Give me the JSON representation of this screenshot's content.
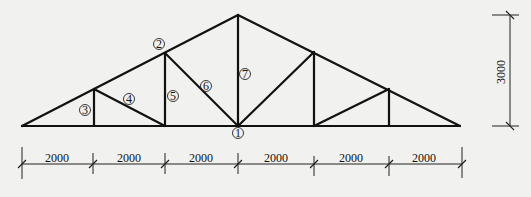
{
  "diagram": {
    "type": "roof truss",
    "members": [
      {
        "id": "1",
        "label": "1",
        "desc": "bottom chord joint at midspan"
      },
      {
        "id": "2",
        "label": "2",
        "desc": "top chord"
      },
      {
        "id": "3",
        "label": "3",
        "desc": "vertical web near support"
      },
      {
        "id": "4",
        "label": "4",
        "desc": "diagonal web"
      },
      {
        "id": "5",
        "label": "5",
        "desc": "vertical web"
      },
      {
        "id": "6",
        "label": "6",
        "desc": "diagonal web"
      },
      {
        "id": "7",
        "label": "7",
        "desc": "central king post"
      }
    ],
    "labels": {
      "m1": "1",
      "m2": "2",
      "m3": "3",
      "m4": "4",
      "m5": "5",
      "m6": "6",
      "m7": "7"
    },
    "span_dimensions": [
      "2000",
      "2000",
      "2000",
      "2000",
      "2000",
      "2000"
    ],
    "height_dimension": "3000",
    "colors": {
      "line": "#111111",
      "background": "#f1f1ef"
    }
  }
}
